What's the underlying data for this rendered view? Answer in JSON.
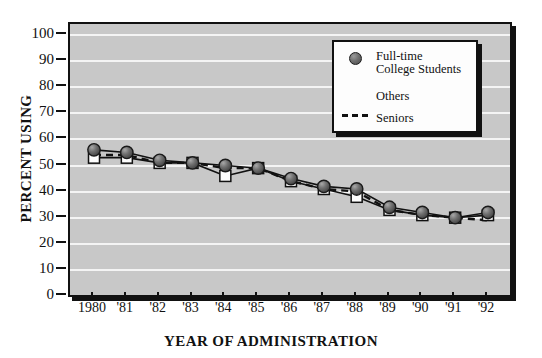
{
  "figure": {
    "top_cut_text": "",
    "x_axis_title": "YEAR OF ADMINISTRATION",
    "y_axis_title": "PERCENT USING"
  },
  "legend": {
    "entries": [
      {
        "label": "Full-time\nCollege Students",
        "marker": "filled-circle-icon"
      },
      {
        "label": "Others",
        "marker": "open-square-icon"
      },
      {
        "label": "Seniors",
        "marker": "dashed-line-icon"
      }
    ]
  },
  "colors": {
    "plot_background": "#c8c8c8",
    "gridline": "#f4f4f4",
    "axis": "#111111",
    "marker_circle_fill": "#6f6f6f",
    "marker_square_fill": "#fdfdfd",
    "line": "#111111",
    "legend_background": "#fdfdfd"
  },
  "chart_data": {
    "type": "line",
    "title": "",
    "xlabel": "YEAR OF ADMINISTRATION",
    "ylabel": "PERCENT USING",
    "categories": [
      "1980",
      "'81",
      "'82",
      "'83",
      "'84",
      "'85",
      "'86",
      "'87",
      "'88",
      "'89",
      "'90",
      "'91",
      "'92"
    ],
    "x_tick_labels": [
      "1980",
      "'81",
      "'82",
      "'83",
      "'84",
      "'85",
      "'86",
      "'87",
      "'88",
      "'89",
      "'90",
      "'91",
      "'92"
    ],
    "y_tick_labels": [
      "0",
      "10",
      "20",
      "30",
      "40",
      "50",
      "60",
      "70",
      "80",
      "90",
      "100"
    ],
    "y_ticks": [
      0,
      10,
      20,
      30,
      40,
      50,
      60,
      70,
      80,
      90,
      100
    ],
    "ylim": [
      0,
      100
    ],
    "grid": true,
    "grid_axis": "y",
    "legend_position": "upper-right-inside",
    "series": [
      {
        "name": "Full-time College Students",
        "marker": "filled-circle-icon",
        "linestyle": "solid",
        "values": [
          56,
          55,
          52,
          51,
          50,
          49,
          45,
          42,
          41,
          34,
          32,
          30,
          32
        ]
      },
      {
        "name": "Others",
        "marker": "open-square-icon",
        "linestyle": "solid",
        "values": [
          53,
          53,
          51,
          51,
          46,
          49,
          44,
          41,
          38,
          33,
          31,
          30,
          31
        ]
      },
      {
        "name": "Seniors",
        "marker": "none",
        "linestyle": "dashed",
        "values": [
          54,
          54,
          51,
          51,
          49,
          49,
          44,
          41,
          40,
          33,
          31,
          30,
          29
        ]
      }
    ]
  }
}
